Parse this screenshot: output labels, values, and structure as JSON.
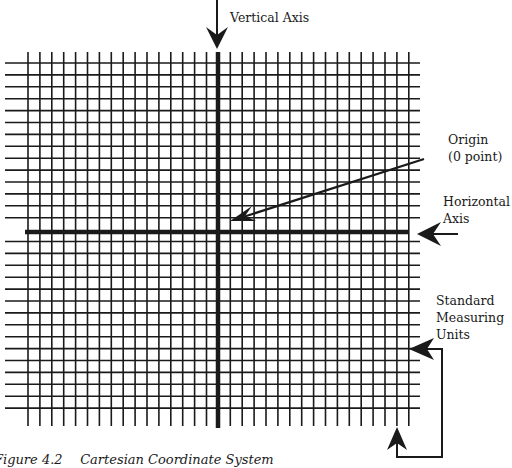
{
  "figure": {
    "caption_number": "Figure 4.2",
    "caption_title": "Cartesian Coordinate System",
    "colors": {
      "ink": "#1a1a1a",
      "background": "#ffffff"
    }
  },
  "labels": {
    "vertical_axis": "Vertical Axis",
    "origin_line1": "Origin",
    "origin_line2": "(0 point)",
    "horizontal_axis_line1": "Horizontal",
    "horizontal_axis_line2": "Axis",
    "units_line1": "Standard",
    "units_line2": "Measuring",
    "units_line3": "Units"
  },
  "grid": {
    "x0": 28,
    "pitch": 11.9,
    "columns_left_of_axis": 16,
    "columns_right_of_axis": 16,
    "y0": 63,
    "rows_above_axis": 14,
    "rows_below_axis": 15,
    "vertical_line_top": 52,
    "vertical_line_bottom": 426,
    "horizontal_line_left": 5,
    "horizontal_line_right": 420
  },
  "axes": {
    "vertical_x": 218,
    "vertical_top": 52,
    "vertical_bottom": 428,
    "horizontal_y": 232,
    "horizontal_left": 25,
    "horizontal_right": 409
  }
}
